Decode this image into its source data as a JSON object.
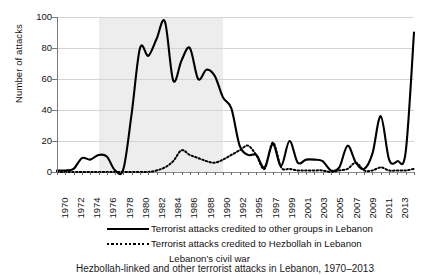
{
  "chart_data": {
    "type": "line",
    "title": "",
    "xlabel": "",
    "ylabel": "Number of attacks",
    "ylim": [
      0,
      100
    ],
    "ytick_values": [
      0,
      20,
      40,
      60,
      80,
      100
    ],
    "grid": true,
    "legend_position": "bottom",
    "x": [
      1970,
      1971,
      1972,
      1973,
      1974,
      1975,
      1976,
      1977,
      1978,
      1979,
      1980,
      1981,
      1982,
      1983,
      1984,
      1985,
      1986,
      1987,
      1988,
      1989,
      1990,
      1991,
      1992,
      1993,
      1994,
      1995,
      1996,
      1997,
      1998,
      1999,
      2000,
      2001,
      2002,
      2003,
      2004,
      2005,
      2006,
      2007,
      2008,
      2009,
      2010,
      2011,
      2012,
      2013
    ],
    "xtick_labels": [
      "1970",
      "1972",
      "1974",
      "1976",
      "1978",
      "1980",
      "1982",
      "1984",
      "1986",
      "1988",
      "1990",
      "1992",
      "1995",
      "1997",
      "1999",
      "2001",
      "2003",
      "2005",
      "2007",
      "2009",
      "2011",
      "2013"
    ],
    "series": [
      {
        "name": "Terrorist attacks credited to other groups in Lebanon",
        "style": "solid",
        "color": "#000000",
        "values": [
          1,
          1,
          2,
          9,
          8,
          11,
          10,
          1,
          2,
          38,
          80,
          75,
          86,
          97,
          59,
          72,
          80,
          60,
          66,
          62,
          48,
          41,
          17,
          11,
          11,
          3,
          18,
          4,
          20,
          6,
          8,
          8,
          7,
          1,
          3,
          17,
          6,
          2,
          12,
          36,
          8,
          7,
          13,
          90
        ]
      },
      {
        "name": "Terrorist attacks credited to Hezbollah in Lebanon",
        "style": "dotted",
        "color": "#000000",
        "values": [
          0,
          0,
          0,
          0,
          0,
          0,
          0,
          0,
          0,
          0,
          0,
          0,
          1,
          3,
          7,
          14,
          11,
          9,
          7,
          6,
          8,
          11,
          14,
          17,
          11,
          2,
          19,
          3,
          2,
          1,
          1,
          1,
          1,
          0,
          1,
          2,
          6,
          1,
          1,
          3,
          1,
          1,
          1,
          2
        ]
      }
    ],
    "shaded_regions": [
      {
        "label": "Lebanon's civil war",
        "start": 1975,
        "end": 1990,
        "color": "#ededee"
      }
    ]
  },
  "legend": {
    "items": [
      {
        "key": "solid",
        "label": "Terrorist attacks credited to other groups in Lebanon"
      },
      {
        "key": "dotted",
        "label": "Terrorist attacks credited to Hezbollah in Lebanon"
      },
      {
        "key": "none",
        "label": "Lebanon’s civil war"
      }
    ]
  },
  "caption": {
    "text": "Hezbollah-linked and other terrorist attacks in Lebanon, 1970–2013"
  }
}
